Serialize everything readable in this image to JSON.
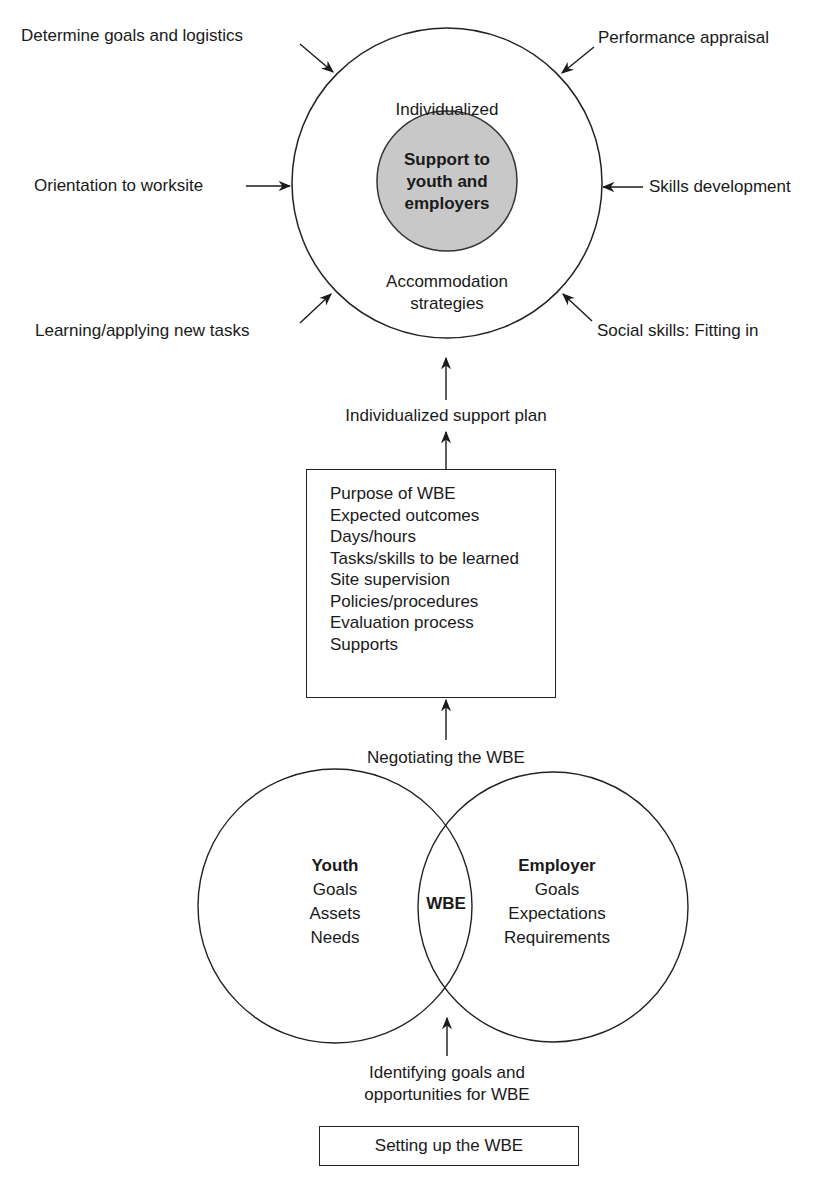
{
  "top_cycle": {
    "outer_ring": {
      "top_label": "Individualized",
      "bottom_label_lines": [
        "Accommodation",
        "strategies"
      ]
    },
    "core": {
      "lines": [
        "Support to",
        "youth and",
        "employers"
      ],
      "fill": "#c8c8c8"
    },
    "inputs": {
      "top_left": "Determine goals and logistics",
      "top_right": "Performance appraisal",
      "mid_left": "Orientation to worksite",
      "mid_right": "Skills development",
      "bottom_left": "Learning/applying new tasks",
      "bottom_right": "Social skills: Fitting in"
    }
  },
  "support_plan_label": "Individualized support plan",
  "agreement_box": {
    "items": [
      "Purpose of WBE",
      "Expected outcomes",
      "Days/hours",
      "Tasks/skills to be learned",
      "Site supervision",
      "Policies/procedures",
      "Evaluation process",
      "Supports"
    ]
  },
  "negotiating_label": "Negotiating the WBE",
  "venn": {
    "left": {
      "title": "Youth",
      "items": [
        "Goals",
        "Assets",
        "Needs"
      ]
    },
    "overlap": "WBE",
    "right": {
      "title": "Employer",
      "items": [
        "Goals",
        "Expectations",
        "Requirements"
      ]
    }
  },
  "identifying_label_lines": [
    "Identifying goals and",
    "opportunities for WBE"
  ],
  "setup_box_label": "Setting up the WBE"
}
